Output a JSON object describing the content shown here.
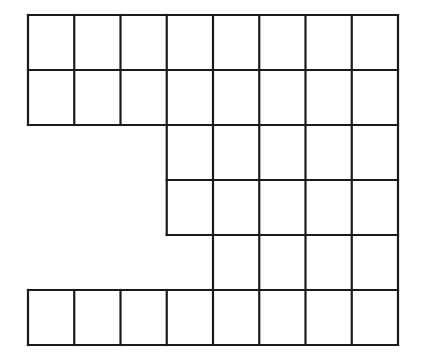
{
  "figure": {
    "type": "grid-diagram",
    "background_color": "#ffffff",
    "line_color": "#1a1a1a",
    "cell_fill_color": "#ffffff",
    "line_width": 2.2,
    "canvas": {
      "width": 422,
      "height": 360
    }
  },
  "grid": {
    "columns": 8,
    "rows": 6,
    "cell_width": 46.25,
    "cell_height": 55,
    "origin_x": 28,
    "origin_y": 15,
    "column_edges_x": [
      28,
      74.25,
      120.5,
      166.75,
      213,
      259.25,
      305.5,
      351.75,
      398
    ],
    "row_edges_y": [
      15,
      70,
      125,
      180,
      235,
      290,
      345
    ],
    "row_spans": [
      {
        "row": 1,
        "start_col": 1,
        "end_col": 8,
        "count": 8
      },
      {
        "row": 2,
        "start_col": 1,
        "end_col": 8,
        "count": 8
      },
      {
        "row": 3,
        "start_col": 4,
        "end_col": 8,
        "count": 5
      },
      {
        "row": 4,
        "start_col": 4,
        "end_col": 8,
        "count": 5
      },
      {
        "row": 5,
        "start_col": 5,
        "end_col": 8,
        "count": 4
      },
      {
        "row": 6,
        "start_col": 1,
        "end_col": 8,
        "count": 8
      }
    ],
    "total_cells": 38
  }
}
